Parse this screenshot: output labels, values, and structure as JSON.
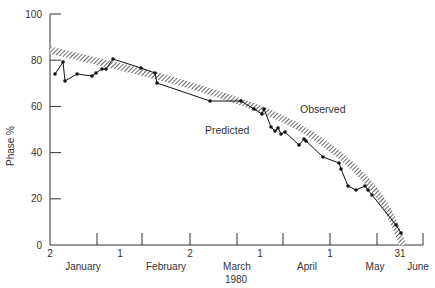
{
  "chart_data": {
    "type": "line",
    "title": "",
    "xlabel": "1980",
    "ylabel": "Phase %",
    "ylim": [
      0,
      100
    ],
    "yticks": [
      0,
      20,
      40,
      60,
      80,
      100
    ],
    "grid": false,
    "legend_position": "inline annotations",
    "x_tick_labels": [
      "2",
      "1",
      "2",
      "1",
      "1",
      "31"
    ],
    "x_tick_label_positions": [
      50,
      120,
      190,
      260,
      330,
      400
    ],
    "month_labels": [
      "January",
      "February",
      "March",
      "April",
      "May",
      "June"
    ],
    "month_label_positions": [
      83,
      166,
      237,
      307,
      375,
      418
    ],
    "x_ticks_px": [
      50,
      97,
      142,
      190,
      237,
      283,
      330,
      377,
      423
    ],
    "annotations": [
      {
        "text": "Observed",
        "x": 300,
        "y": 113
      },
      {
        "text": "Predicted",
        "x": 205,
        "y": 134
      }
    ],
    "series": [
      {
        "name": "Observed",
        "style": "line with dots",
        "points_px": [
          [
            55,
            74
          ],
          [
            63,
            62
          ],
          [
            65,
            81
          ],
          [
            77,
            74
          ],
          [
            92,
            76
          ],
          [
            96,
            73
          ],
          [
            102,
            69
          ],
          [
            106,
            69
          ],
          [
            113,
            59
          ],
          [
            141,
            68
          ],
          [
            155,
            73
          ],
          [
            157,
            83
          ],
          [
            210,
            101
          ],
          [
            241,
            101
          ],
          [
            254,
            109
          ],
          [
            262,
            114
          ],
          [
            264,
            109
          ],
          [
            271,
            127
          ],
          [
            275,
            131
          ],
          [
            278,
            128
          ],
          [
            281,
            134
          ],
          [
            285,
            132
          ],
          [
            299,
            145
          ],
          [
            304,
            139
          ],
          [
            306,
            141
          ],
          [
            323,
            157
          ],
          [
            339,
            163
          ],
          [
            341,
            169
          ],
          [
            348,
            186
          ],
          [
            356,
            190
          ],
          [
            365,
            186
          ],
          [
            368,
            190
          ],
          [
            372,
            195
          ],
          [
            396,
            225
          ],
          [
            401,
            233
          ]
        ],
        "values_approx": [
          {
            "x": "Jan 3",
            "y": 74
          },
          {
            "x": "Jan 7",
            "y": 79
          },
          {
            "x": "Jan 8",
            "y": 71
          },
          {
            "x": "Jan 13",
            "y": 74
          },
          {
            "x": "Jan 19",
            "y": 73
          },
          {
            "x": "Jan 21",
            "y": 75
          },
          {
            "x": "Jan 24",
            "y": 76
          },
          {
            "x": "Jan 25",
            "y": 76
          },
          {
            "x": "Jan 29",
            "y": 80
          },
          {
            "x": "Feb 10",
            "y": 77
          },
          {
            "x": "Feb 16",
            "y": 75
          },
          {
            "x": "Feb 17",
            "y": 70
          },
          {
            "x": "Mar 10",
            "y": 62
          },
          {
            "x": "Mar 23",
            "y": 62
          },
          {
            "x": "Mar 29",
            "y": 59
          },
          {
            "x": "Apr 1",
            "y": 56
          },
          {
            "x": "Apr 2",
            "y": 59
          },
          {
            "x": "Apr 5",
            "y": 51
          },
          {
            "x": "Apr 7",
            "y": 49
          },
          {
            "x": "Apr 8",
            "y": 50
          },
          {
            "x": "Apr 9",
            "y": 48
          },
          {
            "x": "Apr 11",
            "y": 49
          },
          {
            "x": "Apr 17",
            "y": 43
          },
          {
            "x": "Apr 19",
            "y": 46
          },
          {
            "x": "Apr 20",
            "y": 45
          },
          {
            "x": "Apr 27",
            "y": 38
          },
          {
            "x": "May 4",
            "y": 36
          },
          {
            "x": "May 5",
            "y": 33
          },
          {
            "x": "May 8",
            "y": 26
          },
          {
            "x": "May 11",
            "y": 24
          },
          {
            "x": "May 15",
            "y": 26
          },
          {
            "x": "May 16",
            "y": 24
          },
          {
            "x": "May 18",
            "y": 22
          },
          {
            "x": "May 28",
            "y": 9
          },
          {
            "x": "May 30",
            "y": 5
          }
        ]
      },
      {
        "name": "Predicted",
        "style": "hatched band (curve)",
        "points_px": [
          [
            50,
            50
          ],
          [
            100,
            62
          ],
          [
            150,
            74
          ],
          [
            200,
            88
          ],
          [
            250,
            105
          ],
          [
            280,
            117
          ],
          [
            310,
            133
          ],
          [
            340,
            155
          ],
          [
            360,
            173
          ],
          [
            375,
            190
          ],
          [
            385,
            205
          ],
          [
            393,
            220
          ],
          [
            399,
            235
          ],
          [
            403,
            245
          ]
        ],
        "values_approx": [
          {
            "x": "Jan 2",
            "y": 84
          },
          {
            "x": "Feb 1",
            "y": 78
          },
          {
            "x": "Mar 1",
            "y": 69
          },
          {
            "x": "Apr 1",
            "y": 55
          },
          {
            "x": "May 1",
            "y": 33
          },
          {
            "x": "May 15",
            "y": 20
          },
          {
            "x": "May 31",
            "y": 0
          }
        ]
      }
    ]
  },
  "axis": {
    "y_title": "Phase %",
    "x_title": "1980",
    "y_tick_labels": [
      "100",
      "80",
      "60",
      "40",
      "20",
      "0"
    ]
  },
  "labels": {
    "observed": "Observed",
    "predicted": "Predicted"
  }
}
